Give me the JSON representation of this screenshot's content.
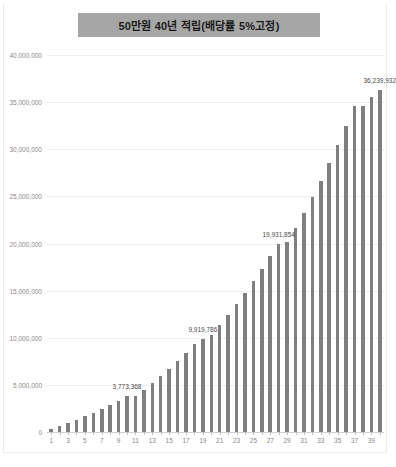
{
  "chart_data": {
    "type": "bar",
    "title": "50만원 40년 적립(배당률 5%고정)",
    "xlabel": "",
    "ylabel": "",
    "ylim": [
      0,
      40000000
    ],
    "ytick_values": [
      0,
      5000000,
      10000000,
      15000000,
      20000000,
      25000000,
      30000000,
      35000000,
      40000000
    ],
    "ytick_labels": [
      "0",
      "5,000,000",
      "10,000,000",
      "15,000,000",
      "20,000,000",
      "25,000,000",
      "30,000,000",
      "35,000,000",
      "40,000,000"
    ],
    "grid": true,
    "legend": false,
    "bar_color": "#7f7f7f",
    "title_background": "#a6a6a6",
    "categories": [
      1,
      2,
      3,
      4,
      5,
      6,
      7,
      8,
      9,
      10,
      11,
      12,
      13,
      14,
      15,
      16,
      17,
      18,
      19,
      20,
      21,
      22,
      23,
      24,
      25,
      26,
      27,
      28,
      29,
      30,
      31,
      32,
      33,
      34,
      35,
      36,
      37,
      38,
      39,
      40
    ],
    "xtick_labels": [
      "1",
      "3",
      "5",
      "7",
      "9",
      "11",
      "13",
      "15",
      "17",
      "19",
      "21",
      "23",
      "25",
      "27",
      "29",
      "31",
      "33",
      "35",
      "37",
      "39"
    ],
    "values": [
      300000,
      615000,
      945750,
      1293038,
      1657689,
      2040574,
      2442602,
      2864732,
      3307969,
      3773368,
      3773368,
      4458036,
      5175938,
      5929735,
      6721222,
      7553283,
      8428947,
      9351395,
      9919786,
      10323964,
      11350162,
      12427670,
      13559054,
      14747007,
      15994357,
      17304075,
      18679279,
      19931854,
      20123243,
      21639405,
      23231375,
      24902944,
      26658091,
      28500995,
      30436045,
      32467847,
      34601240,
      34601240,
      35500000,
      36239932
    ],
    "labeled_points": [
      {
        "category": 10,
        "value": 3773368,
        "label": "3,773,368"
      },
      {
        "category": 19,
        "value": 9919786,
        "label": "9,919,786"
      },
      {
        "category": 28,
        "value": 19931854,
        "label": "19,931,854"
      },
      {
        "category": 40,
        "value": 36239932,
        "label": "36,239,932"
      }
    ]
  }
}
